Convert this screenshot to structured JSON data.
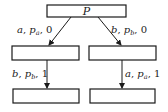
{
  "diagram": {
    "root": {
      "label": "P"
    },
    "edges": [
      {
        "id": "root-left",
        "var": "a",
        "prob_base": "p",
        "prob_sub": "a",
        "value": "0"
      },
      {
        "id": "root-right",
        "var": "b",
        "prob_base": "p",
        "prob_sub": "b",
        "value": "0"
      },
      {
        "id": "left-down",
        "var": "b",
        "prob_base": "p",
        "prob_sub": "b",
        "value": "1"
      },
      {
        "id": "right-down",
        "var": "a",
        "prob_base": "p",
        "prob_sub": "a",
        "value": "1"
      }
    ],
    "nodes": [
      {
        "id": "left-middle",
        "label": ""
      },
      {
        "id": "right-middle",
        "label": ""
      },
      {
        "id": "left-bottom",
        "label": ""
      },
      {
        "id": "right-bottom",
        "label": ""
      }
    ],
    "separator": ", "
  }
}
